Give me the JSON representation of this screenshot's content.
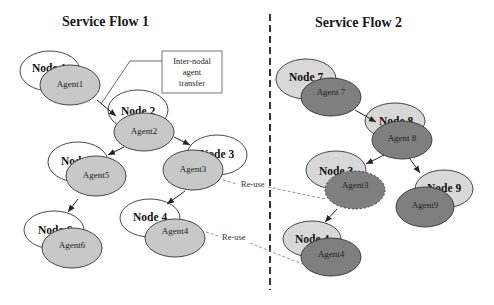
{
  "titles": {
    "flow1": "Service Flow 1",
    "flow2": "Service Flow 2"
  },
  "note": {
    "line1": "Inter-nodal",
    "line2": "agent",
    "line3": "transfer"
  },
  "colors": {
    "flow1_node_fill": "#ffffff",
    "flow1_agent_fill": "#c8c8c8",
    "flow2_node_fill": "#d8d8d8",
    "flow2_agent_fill": "#7f7f7f",
    "outline": "#333333",
    "reuse_line": "#888888"
  },
  "flow1": {
    "nodes": [
      {
        "label": "Node 1",
        "agent": "Agent1"
      },
      {
        "label": "Node 2",
        "agent": "Agent2"
      },
      {
        "label": "Node 3",
        "agent": "Agent3"
      },
      {
        "label": "Node 5",
        "agent": "Agent5"
      },
      {
        "label": "Node 4",
        "agent": "Agent4"
      },
      {
        "label": "Node 6",
        "agent": "Agent6"
      }
    ]
  },
  "flow2": {
    "nodes": [
      {
        "label": "Node 7",
        "agent": "Agent 7"
      },
      {
        "label": "Node 8",
        "agent": "Agent 8"
      },
      {
        "label": "Node 3",
        "agent": "Agent3"
      },
      {
        "label": "Node 9",
        "agent": "Agent9"
      },
      {
        "label": "Node 4",
        "agent": "Agent4"
      }
    ]
  },
  "reuse_labels": {
    "agent3": "Re-use",
    "agent4": "Re-use"
  }
}
